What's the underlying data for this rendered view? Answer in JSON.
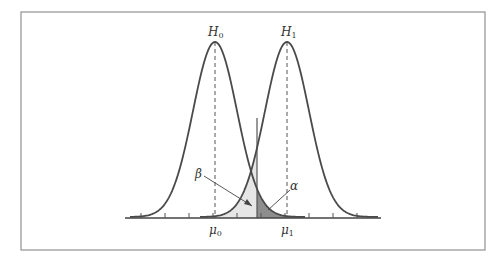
{
  "figure": {
    "h0_label": "H",
    "h0_sub": "0",
    "h1_label": "H",
    "h1_sub": "1",
    "beta_label": "β",
    "alpha_label": "α",
    "mu0_label": "μ",
    "mu0_sub": "0",
    "mu1_label": "μ",
    "mu1_sub": "1"
  },
  "colors": {
    "curve": "#4a4a4a",
    "frame": "#9a9a9a",
    "beta_fill": "#e4e4e4",
    "alpha_fill": "#8c8c8c"
  }
}
